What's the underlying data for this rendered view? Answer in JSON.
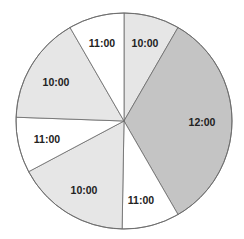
{
  "chart_data": {
    "type": "pie",
    "title": "",
    "start_angle_deg": 0,
    "direction": "clockwise",
    "center": [
      124,
      121
    ],
    "radius": 108,
    "slices": [
      {
        "label": "10:00",
        "start": 0,
        "end": 30,
        "color": "#e6e6e6",
        "label_pos": [
          145,
          43
        ]
      },
      {
        "label": "12:00",
        "start": 30,
        "end": 150,
        "color": "#c4c4c4",
        "label_pos": [
          202,
          122
        ]
      },
      {
        "label": "11:00",
        "start": 150,
        "end": 181,
        "color": "#ffffff",
        "label_pos": [
          141,
          200
        ]
      },
      {
        "label": "10:00",
        "start": 181,
        "end": 242,
        "color": "#e6e6e6",
        "label_pos": [
          84,
          190
        ]
      },
      {
        "label": "11:00",
        "start": 242,
        "end": 272,
        "color": "#ffffff",
        "label_pos": [
          47,
          139
        ]
      },
      {
        "label": "10:00",
        "start": 272,
        "end": 330,
        "color": "#e6e6e6",
        "label_pos": [
          56,
          82
        ]
      },
      {
        "label": "11:00",
        "start": 330,
        "end": 360,
        "color": "#ffffff",
        "label_pos": [
          102,
          43
        ]
      }
    ],
    "categories": [
      "10:00",
      "12:00",
      "11:00",
      "10:00",
      "11:00",
      "10:00",
      "11:00"
    ],
    "values": [
      30,
      120,
      31,
      61,
      30,
      58,
      30
    ],
    "legend": null,
    "grid": false
  }
}
